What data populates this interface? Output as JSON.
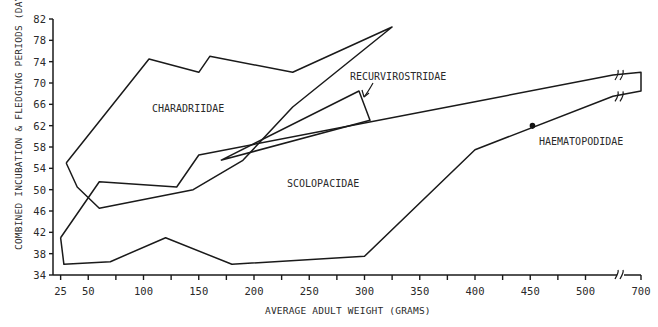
{
  "chart_data": {
    "type": "area",
    "title": "",
    "xlabel": "AVERAGE ADULT WEIGHT (GRAMS)",
    "ylabel": "COMBINED INCUBATION & FLEDGING PERIODS (DAYS)",
    "x_ticks": [
      "25",
      "50",
      "100",
      "150",
      "200",
      "250",
      "300",
      "350",
      "400",
      "450",
      "500",
      "700"
    ],
    "y_ticks": [
      "34",
      "38",
      "42",
      "46",
      "50",
      "54",
      "58",
      "62",
      "66",
      "70",
      "74",
      "78",
      "82"
    ],
    "ylim": [
      34,
      82
    ],
    "xlim": [
      25,
      700
    ],
    "x_axis_break": "between 500 and 700",
    "grid": false,
    "legend": "none (direct labels)",
    "series": [
      {
        "name": "CHARADRIIDAE",
        "shape": "polygon",
        "points": [
          [
            30,
            55
          ],
          [
            105,
            74.5
          ],
          [
            150,
            72
          ],
          [
            160,
            75
          ],
          [
            235,
            72
          ],
          [
            325,
            80.5
          ],
          [
            235,
            65.5
          ],
          [
            190,
            55.5
          ],
          [
            145,
            50
          ],
          [
            60,
            46.5
          ],
          [
            40,
            50.5
          ],
          [
            30,
            55
          ]
        ]
      },
      {
        "name": "SCOLOPACIDAE",
        "shape": "polygon",
        "points": [
          [
            25,
            41
          ],
          [
            60,
            51.5
          ],
          [
            130,
            50.5
          ],
          [
            150,
            56.5
          ],
          [
            400,
            66.5
          ],
          [
            600,
            71.5
          ],
          [
            700,
            72
          ],
          [
            700,
            68.5
          ],
          [
            600,
            67.5
          ],
          [
            400,
            57.5
          ],
          [
            300,
            37.5
          ],
          [
            180,
            36
          ],
          [
            120,
            41
          ],
          [
            70,
            36.5
          ],
          [
            28,
            36
          ],
          [
            25,
            41
          ]
        ]
      },
      {
        "name": "RECURVIROSTRIDAE",
        "shape": "polygon",
        "points": [
          [
            170,
            55.5
          ],
          [
            295,
            68.5
          ],
          [
            305,
            63
          ],
          [
            170,
            55.5
          ]
        ]
      },
      {
        "name": "HAEMATOPODIDAE",
        "shape": "point",
        "points": [
          [
            452,
            62
          ]
        ]
      }
    ],
    "annotations": [
      {
        "text": "CHARADRIIDAE",
        "x": 130,
        "y": 67
      },
      {
        "text": "SCOLOPACIDAE",
        "x": 260,
        "y": 51
      },
      {
        "text": "RECURVIROSTRIDAE",
        "x": 320,
        "y": 71
      },
      {
        "text": "HAEMATOPODIDAE",
        "x": 470,
        "y": 59
      }
    ]
  },
  "labels": {
    "xlabel": "AVERAGE ADULT WEIGHT (GRAMS)",
    "ylabel": "COMBINED INCUBATION & FLEDGING PERIODS (DAYS)",
    "charadriidae": "CHARADRIIDAE",
    "scolopacidae": "SCOLOPACIDAE",
    "recurvirostridae": "RECURVIROSTRIDAE",
    "haematopodidae": "HAEMATOPODIDAE"
  }
}
